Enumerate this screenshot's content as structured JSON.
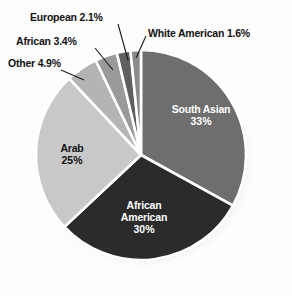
{
  "chart_data": {
    "type": "pie",
    "title": "",
    "categories": [
      "South Asian",
      "African American",
      "Arab",
      "Other",
      "African",
      "European",
      "White American"
    ],
    "values": [
      33,
      30,
      25,
      4.9,
      3.4,
      2.1,
      1.6
    ],
    "slices": [
      {
        "label": "South Asian",
        "value": 33,
        "value_text": "33%",
        "color": "#6e6e6e",
        "label_position": "inside",
        "text_color": "#ffffff"
      },
      {
        "label": "African American",
        "value": 30,
        "value_text": "30%",
        "color": "#2b2b2b",
        "label_position": "inside",
        "text_color": "#ffffff"
      },
      {
        "label": "Arab",
        "value": 25,
        "value_text": "25%",
        "color": "#c8c8c8",
        "label_position": "inside",
        "text_color": "#111111"
      },
      {
        "label": "Other",
        "value": 4.9,
        "value_text": "4.9%",
        "color": "#b4b4b4",
        "label_position": "outside",
        "text_color": "#111111"
      },
      {
        "label": "African",
        "value": 3.4,
        "value_text": "3.4%",
        "color": "#9a9a9a",
        "label_position": "outside",
        "text_color": "#111111"
      },
      {
        "label": "European",
        "value": 2.1,
        "value_text": "2.1%",
        "color": "#5f5f5f",
        "label_position": "outside",
        "text_color": "#111111"
      },
      {
        "label": "White American",
        "value": 1.6,
        "value_text": "1.6%",
        "color": "#8a8a8a",
        "label_position": "outside",
        "text_color": "#111111"
      }
    ],
    "legend": "none",
    "grid": false,
    "separator_color": "#ffffff",
    "background": "#fdfdfd"
  },
  "outside_labels": {
    "european": "European 2.1%",
    "african": "African 3.4%",
    "other": "Other 4.9%",
    "white_american": "White American 1.6%"
  },
  "inside_labels": {
    "south_asian_name": "South Asian",
    "south_asian_pct": "33%",
    "african_american_name_line1": "African",
    "african_american_name_line2": "American",
    "african_american_pct": "30%",
    "arab_name": "Arab",
    "arab_pct": "25%"
  },
  "credit": {
    "text": "DIMARIO, CREATIVECOMMONS.ORG/LICENSES/BY/3.0/DEED.EN"
  }
}
